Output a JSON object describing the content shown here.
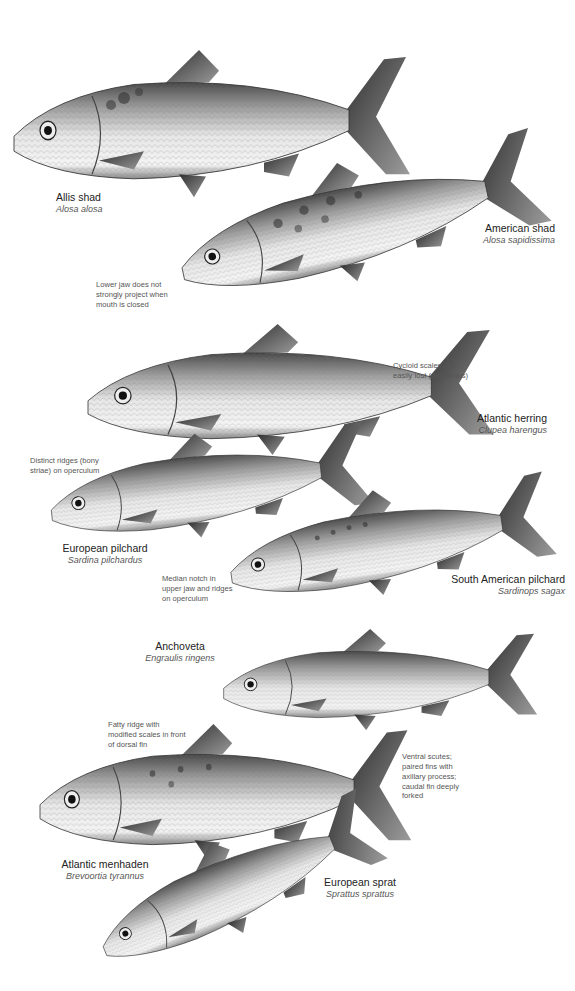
{
  "figure": {
    "species": [
      {
        "common": "Allis shad",
        "scientific": "Alosa alosa"
      },
      {
        "common": "American shad",
        "scientific": "Alosa sapidissima"
      },
      {
        "common": "Atlantic herring",
        "scientific": "Clupea harengus"
      },
      {
        "common": "European pilchard",
        "scientific": "Sardina pilchardus"
      },
      {
        "common": "South American pilchard",
        "scientific": "Sardinops sagax"
      },
      {
        "common": "Anchoveta",
        "scientific": "Engraulis ringens"
      },
      {
        "common": "Atlantic menhaden",
        "scientific": "Brevoortia tyrannus"
      },
      {
        "common": "European sprat",
        "scientific": "Sprattus sprattus"
      }
    ],
    "notes": {
      "american_shad": "Lower jaw does not strongly project when mouth is closed",
      "atlantic_herring": "Cycloid scales are easily lost (deciduous)",
      "european_pilchard": "Distinct ridges (bony striae) on operculum",
      "south_american_pilchard": "Median notch in upper jaw and ridges on operculum",
      "menhaden_fatty_ridge": "Fatty ridge with modified scales in front of dorsal fin",
      "menhaden_scutes": "Ventral scutes; paired fins with axillary process; caudal fin deeply forked"
    },
    "colors": {
      "background": "#ffffff",
      "fish_body": "#c8c8c8",
      "fish_dark": "#3a3a3a",
      "text": "#222222",
      "note_text": "#555555"
    }
  }
}
